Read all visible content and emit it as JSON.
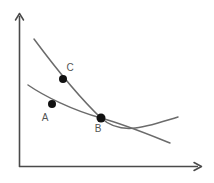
{
  "figure": {
    "title": "",
    "background_color": "#ffffff",
    "width": 214,
    "height": 183
  },
  "axes": {
    "x_axis_name": "x-axis",
    "y_axis_name": "y-axis",
    "x_label": "",
    "y_label": "",
    "axis_color": "#4a4a4a",
    "origin": {
      "x": 19,
      "y": 167
    },
    "x_end": {
      "x": 202,
      "y": 167
    },
    "y_end": {
      "x": 19,
      "y": 13
    },
    "ticks": [],
    "tick_labels": []
  },
  "chart_data": {
    "type": "line",
    "title": "",
    "xlabel": "",
    "ylabel": "",
    "grid": false,
    "legend": "none",
    "xlim": [
      0,
      214
    ],
    "ylim": [
      0,
      183
    ],
    "curve_color": "#6b6b6b",
    "point_color": "#111111",
    "series": [
      {
        "name": "steep-curve",
        "description": "steeper downward sloping convex curve passing through C and B, flattening to the right",
        "path": "M 34 39 C 60 74, 82 100, 101 118 C 122 137, 148 126, 178 117",
        "points": [
          {
            "x": 34,
            "y": 39
          },
          {
            "x": 63,
            "y": 79
          },
          {
            "x": 101,
            "y": 118
          },
          {
            "x": 140,
            "y": 122
          },
          {
            "x": 178,
            "y": 117
          }
        ]
      },
      {
        "name": "flat-curve",
        "description": "flatter downward sloping convex curve passing through A and B, continuing down to the right",
        "path": "M 28 85 C 44 96, 72 110, 101 118 C 126 125, 150 135, 170 143",
        "points": [
          {
            "x": 28,
            "y": 85
          },
          {
            "x": 52,
            "y": 104
          },
          {
            "x": 101,
            "y": 118
          },
          {
            "x": 140,
            "y": 132
          },
          {
            "x": 170,
            "y": 143
          }
        ]
      }
    ],
    "labeled_points": [
      {
        "id": "A",
        "label": "A",
        "x": 52,
        "y": 104,
        "label_x": 45,
        "label_y": 118,
        "radius": 4
      },
      {
        "id": "B",
        "label": "B",
        "x": 101,
        "y": 118,
        "label_x": 98,
        "label_y": 129,
        "radius": 4.5
      },
      {
        "id": "C",
        "label": "C",
        "x": 63,
        "y": 79,
        "label_x": 70,
        "label_y": 68,
        "radius": 4
      }
    ],
    "annotations": []
  }
}
